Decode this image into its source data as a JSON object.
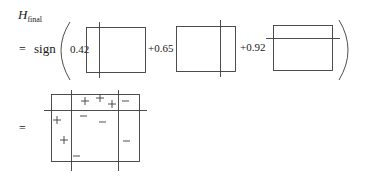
{
  "formula": {
    "lhs_symbol": "H",
    "lhs_subscript": "final",
    "equals": "=",
    "function_name": "sign",
    "terms": [
      {
        "coefficient": "0.42",
        "classifier": {
          "split": "vertical",
          "split_x_frac": 0.22
        }
      },
      {
        "coefficient": "+0.65",
        "classifier": {
          "split": "vertical",
          "split_x_frac": 0.75
        }
      },
      {
        "coefficient": "+0.92",
        "classifier": {
          "split": "horizontal",
          "split_y_frac": 0.29
        }
      }
    ]
  },
  "result": {
    "equals": "=",
    "plus_symbol": "+",
    "minus_symbol": "−",
    "marks": [
      {
        "sign": "+",
        "x": 85,
        "y": 101
      },
      {
        "sign": "+",
        "x": 100,
        "y": 98
      },
      {
        "sign": "+",
        "x": 112,
        "y": 104
      },
      {
        "sign": "−",
        "x": 125,
        "y": 101
      },
      {
        "sign": "+",
        "x": 57,
        "y": 120
      },
      {
        "sign": "−",
        "x": 83,
        "y": 116
      },
      {
        "sign": "−",
        "x": 102,
        "y": 122
      },
      {
        "sign": "+",
        "x": 64,
        "y": 140
      },
      {
        "sign": "−",
        "x": 126,
        "y": 141
      },
      {
        "sign": "−",
        "x": 76,
        "y": 156
      }
    ]
  },
  "colors": {
    "stroke": "#3a3a3a",
    "text": "#1a1a1a",
    "background": "#ffffff"
  }
}
